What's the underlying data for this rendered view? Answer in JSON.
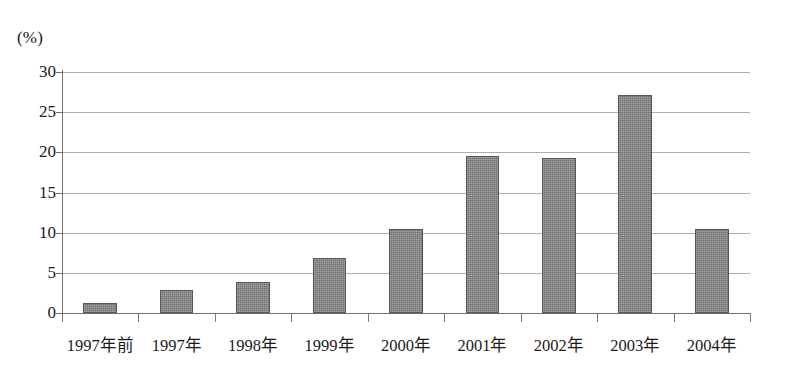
{
  "chart_data": {
    "type": "bar",
    "title": "",
    "subtitle": "",
    "xlabel": "",
    "ylabel": "(%)",
    "unit_label": "(%)",
    "categories": [
      "1997年前",
      "1997年",
      "1998年",
      "1999年",
      "2000年",
      "2001年",
      "2002年",
      "2003年",
      "2004年"
    ],
    "values": [
      1.2,
      2.9,
      3.8,
      6.9,
      10.4,
      19.6,
      19.3,
      27.2,
      10.5
    ],
    "series": [
      {
        "name": "",
        "values": [
          1.2,
          2.9,
          3.8,
          6.9,
          10.4,
          19.6,
          19.3,
          27.2,
          10.5
        ]
      }
    ],
    "ylim": [
      0,
      30
    ],
    "ytick_labels": [
      "0",
      "5",
      "10",
      "15",
      "20",
      "25",
      "30"
    ],
    "ytick_values": [
      0,
      5,
      10,
      15,
      20,
      25,
      30
    ],
    "grid": true,
    "legend": false,
    "legend_position": "none",
    "bar_color": "#6e6e6e",
    "gridline_color": "#aeaeae",
    "axis_color": "#6f6f6f",
    "background_color": "#ffffff"
  }
}
